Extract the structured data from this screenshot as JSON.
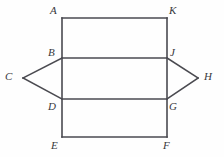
{
  "figure": {
    "kind": "geometry-diagram",
    "canvas": {
      "width": 224,
      "height": 157
    },
    "colors": {
      "background": "#fefefe",
      "stroke": "#4a4a50",
      "label": "#38383c"
    },
    "stroke_width": 1.6,
    "vertices": [
      {
        "id": "A",
        "label": "A",
        "point_x": 62,
        "point_y": 18,
        "label_x": 50,
        "label_y": 5
      },
      {
        "id": "K",
        "label": "K",
        "point_x": 167,
        "point_y": 18,
        "label_x": 169,
        "label_y": 5
      },
      {
        "id": "B",
        "label": "B",
        "point_x": 62,
        "point_y": 58,
        "label_x": 48,
        "label_y": 47
      },
      {
        "id": "J",
        "label": "J",
        "point_x": 167,
        "point_y": 58,
        "label_x": 170,
        "label_y": 47
      },
      {
        "id": "C",
        "label": "C",
        "point_x": 23,
        "point_y": 78,
        "label_x": 5,
        "label_y": 71
      },
      {
        "id": "H",
        "label": "H",
        "point_x": 198,
        "point_y": 78,
        "label_x": 204,
        "label_y": 71
      },
      {
        "id": "D",
        "label": "D",
        "point_x": 62,
        "point_y": 99,
        "label_x": 48,
        "label_y": 101
      },
      {
        "id": "G",
        "label": "G",
        "point_x": 167,
        "point_y": 99,
        "label_x": 169,
        "label_y": 101
      },
      {
        "id": "E",
        "label": "E",
        "point_x": 62,
        "point_y": 137,
        "label_x": 51,
        "label_y": 140
      },
      {
        "id": "F",
        "label": "F",
        "point_x": 167,
        "point_y": 137,
        "label_x": 163,
        "label_y": 140
      }
    ],
    "segments": [
      {
        "name": "top-edge-A-K",
        "x1": 62,
        "y1": 18,
        "x2": 167,
        "y2": 18
      },
      {
        "name": "bottom-edge-E-F",
        "x1": 62,
        "y1": 137,
        "x2": 167,
        "y2": 137
      },
      {
        "name": "left-edge-A-E",
        "x1": 62,
        "y1": 18,
        "x2": 62,
        "y2": 137
      },
      {
        "name": "right-edge-K-F",
        "x1": 167,
        "y1": 18,
        "x2": 167,
        "y2": 137
      },
      {
        "name": "middle-upper-B-J",
        "x1": 62,
        "y1": 58,
        "x2": 167,
        "y2": 58
      },
      {
        "name": "middle-lower-D-G",
        "x1": 62,
        "y1": 99,
        "x2": 167,
        "y2": 99
      },
      {
        "name": "left-flap-B-C",
        "x1": 62,
        "y1": 58,
        "x2": 23,
        "y2": 78
      },
      {
        "name": "left-flap-C-D",
        "x1": 23,
        "y1": 78,
        "x2": 62,
        "y2": 99
      },
      {
        "name": "right-flap-J-H",
        "x1": 167,
        "y1": 58,
        "x2": 198,
        "y2": 78
      },
      {
        "name": "right-flap-H-G",
        "x1": 198,
        "y1": 78,
        "x2": 167,
        "y2": 99
      }
    ]
  }
}
